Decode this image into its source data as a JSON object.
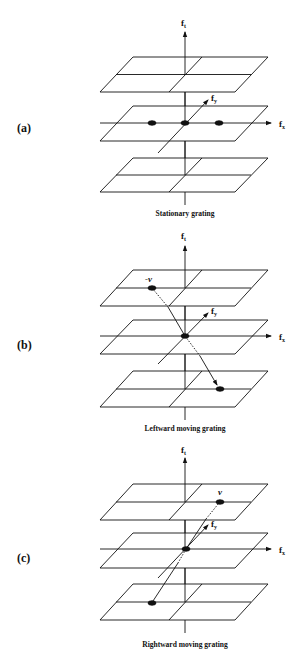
{
  "figure": {
    "panels": [
      {
        "id": "a",
        "label": "(a)",
        "caption": "Stationary grating",
        "axes": {
          "ft": "f",
          "ft_sub": "t",
          "fx": "f",
          "fx_sub": "x",
          "fy": "f",
          "fy_sub": "y"
        },
        "velocity_label": "",
        "dots": "three dots on fx axis in middle plane (at -f, 0, +f)"
      },
      {
        "id": "b",
        "label": "(b)",
        "caption": "Leftward moving grating",
        "axes": {
          "ft": "f",
          "ft_sub": "t",
          "fx": "f",
          "fx_sub": "x",
          "fy": "f",
          "fy_sub": "y"
        },
        "velocity_label": "-v",
        "dots": "dot at upper-left of top plane, center, lower-right of bottom plane"
      },
      {
        "id": "c",
        "label": "(c)",
        "caption": "Rightward moving grating",
        "axes": {
          "ft": "f",
          "ft_sub": "t",
          "fx": "f",
          "fx_sub": "x",
          "fy": "f",
          "fy_sub": "y"
        },
        "velocity_label": "v",
        "dots": "dot at upper-right of top plane, center, lower-left of bottom plane"
      }
    ]
  }
}
